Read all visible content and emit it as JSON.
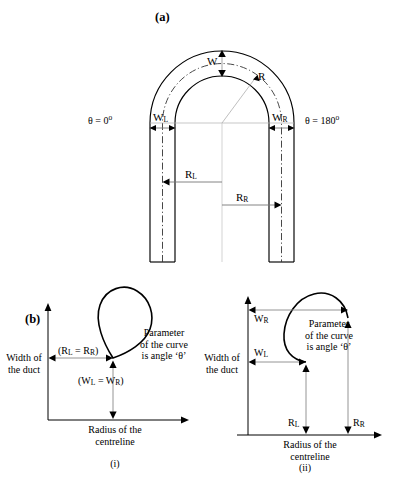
{
  "figure": {
    "panel_a": {
      "tag": "(a)",
      "labels": {
        "w": "W",
        "r": "R",
        "theta_left": "θ = 0",
        "theta_left_sup": "o",
        "theta_right": "θ = 180",
        "theta_right_sup": "o",
        "w_left": "W",
        "w_left_sub": "L",
        "w_right": "W",
        "w_right_sub": "R",
        "r_left": "R",
        "r_left_sub": "L",
        "r_right": "R",
        "r_right_sub": "R"
      }
    },
    "panel_b": {
      "tag": "(b)",
      "sub_i": {
        "caption": "(i)",
        "y_axis_label_line1": "Width of",
        "y_axis_label_line2": "the duct",
        "x_axis_label_line1": "Radius of the",
        "x_axis_label_line2": "centreline",
        "radius_label_open": "(R",
        "radius_label_sub1": "L",
        "radius_label_mid": " = R",
        "radius_label_sub2": "R",
        "radius_label_close": ")",
        "width_label_open": "(W",
        "width_label_sub1": "L",
        "width_label_mid": " = W",
        "width_label_sub2": "R",
        "width_label_close": ")",
        "note_line1": "Parameter",
        "note_line2": "of the curve",
        "note_line3": "is angle ‘θ’"
      },
      "sub_ii": {
        "caption": "(ii)",
        "y_axis_label_line1": "Width of",
        "y_axis_label_line2": "the duct",
        "x_axis_label_line1": "Radius of the",
        "x_axis_label_line2": "centreline",
        "w_right": "W",
        "w_right_sub": "R",
        "w_left": "W",
        "w_left_sub": "L",
        "r_left": "R",
        "r_left_sub": "L",
        "r_right": "R",
        "r_right_sub": "R",
        "note_line1": "Parameter",
        "note_line2": "of the curve",
        "note_line3": "is angle ‘θ’"
      }
    },
    "colors": {
      "stroke": "#000000",
      "dimension": "#808080",
      "centerline": "#555555",
      "background": "#ffffff"
    }
  }
}
